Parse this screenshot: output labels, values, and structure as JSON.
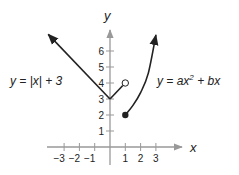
{
  "chart_data": {
    "type": "line",
    "title": "",
    "xlabel": "x",
    "ylabel": "y",
    "xlim": [
      -4,
      4
    ],
    "ylim": [
      0,
      7
    ],
    "x_ticks": [
      -3,
      -2,
      -1,
      1,
      2,
      3
    ],
    "y_ticks": [
      1,
      2,
      3,
      4,
      5,
      6
    ],
    "grid": false,
    "series": [
      {
        "name": "y = |x| + 3",
        "label": "y  =  |x|  +  3",
        "points": [
          [
            -4.1,
            7.1
          ],
          [
            0,
            3
          ],
          [
            1,
            4
          ]
        ],
        "left_end": "arrow",
        "right_end": "open-circle",
        "color": "#222222"
      },
      {
        "name": "y = ax^2 + bx",
        "label_parts": [
          "y  =  ax",
          "2",
          "  +  bx"
        ],
        "points": [
          [
            1,
            2
          ],
          [
            1.5,
            2.6
          ],
          [
            2,
            3.4
          ],
          [
            2.5,
            4.6
          ],
          [
            3,
            7.0
          ]
        ],
        "left_end": "closed-circle",
        "right_end": "arrow",
        "color": "#222222"
      }
    ]
  }
}
